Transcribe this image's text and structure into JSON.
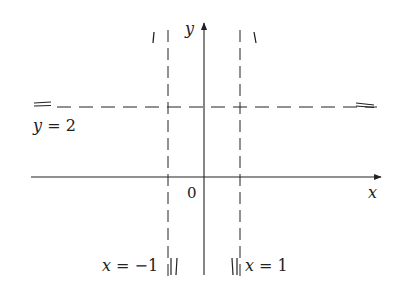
{
  "figure": {
    "axes": {
      "x_label": "x",
      "y_label": "y",
      "origin_label": "0"
    },
    "asymptotes": {
      "horizontal": {
        "label": "y = 2",
        "value": 2
      },
      "vertical_left": {
        "label": "x = −1",
        "value": -1
      },
      "vertical_right": {
        "label": "x = 1",
        "value": 1
      }
    },
    "colors": {
      "line": "#222222",
      "background": "#ffffff"
    }
  }
}
